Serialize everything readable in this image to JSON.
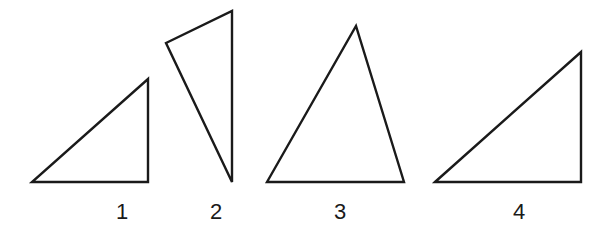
{
  "diagram": {
    "stroke_color": "#1a1a1a",
    "background": "#ffffff",
    "triangles": [
      {
        "label": "1",
        "points": [
          [
            32,
            182
          ],
          [
            148,
            182
          ],
          [
            148,
            79
          ]
        ],
        "label_pos": [
          122,
          212
        ],
        "type": "right"
      },
      {
        "label": "2",
        "points": [
          [
            166,
            43
          ],
          [
            232,
            11
          ],
          [
            232,
            182
          ]
        ],
        "label_pos": [
          216,
          212
        ],
        "type": "obtuse"
      },
      {
        "label": "3",
        "points": [
          [
            267,
            182
          ],
          [
            356,
            26
          ],
          [
            404,
            182
          ]
        ],
        "label_pos": [
          340,
          212
        ],
        "type": "acute"
      },
      {
        "label": "4",
        "points": [
          [
            435,
            182
          ],
          [
            581,
            52
          ],
          [
            581,
            182
          ]
        ],
        "label_pos": [
          519,
          212
        ],
        "type": "right"
      }
    ]
  }
}
